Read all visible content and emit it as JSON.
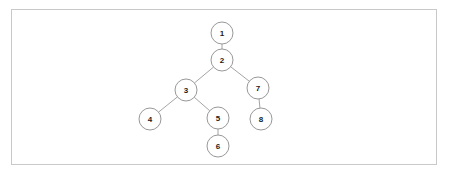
{
  "page": {
    "background_color": "#ffffff"
  },
  "frame": {
    "border_color": "#c9c9c9",
    "fill_color": "#ffffff",
    "x": 11,
    "y": 9,
    "width": 426,
    "height": 156
  },
  "chart_data": {
    "type": "diagram",
    "subtype": "tree",
    "title": "",
    "node_radius": 11,
    "node_stroke_color": "#8c8c8c",
    "node_fill_color": "#ffffff",
    "edge_color": "#9a9a9a",
    "label_color": "#1a1a1a",
    "nodes": [
      {
        "id": "n1",
        "label": "1",
        "x": 222,
        "y": 33
      },
      {
        "id": "n2",
        "label": "2",
        "x": 222,
        "y": 60
      },
      {
        "id": "n3",
        "label": "3",
        "x": 186,
        "y": 90
      },
      {
        "id": "n4",
        "label": "4",
        "x": 150,
        "y": 119
      },
      {
        "id": "n5",
        "label": "5",
        "x": 218,
        "y": 118
      },
      {
        "id": "n6",
        "label": "6",
        "x": 218,
        "y": 146
      },
      {
        "id": "n7",
        "label": "7",
        "x": 258,
        "y": 88
      },
      {
        "id": "n8",
        "label": "8",
        "x": 261,
        "y": 119
      }
    ],
    "edges": [
      {
        "id": "e1",
        "from": "n1",
        "to": "n2"
      },
      {
        "id": "e2",
        "from": "n2",
        "to": "n3"
      },
      {
        "id": "e3",
        "from": "n2",
        "to": "n7"
      },
      {
        "id": "e4",
        "from": "n3",
        "to": "n4"
      },
      {
        "id": "e5",
        "from": "n3",
        "to": "n5"
      },
      {
        "id": "e6",
        "from": "n5",
        "to": "n6"
      },
      {
        "id": "e7",
        "from": "n7",
        "to": "n8"
      }
    ]
  }
}
